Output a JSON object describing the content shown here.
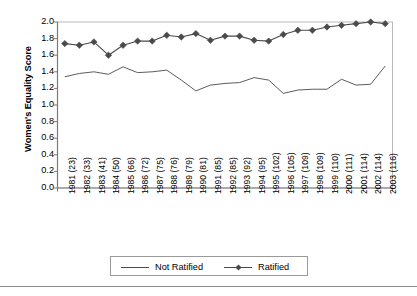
{
  "chart_data": {
    "type": "line",
    "title": "",
    "xlabel": "",
    "ylabel": "Women's Equality Score",
    "ylim": [
      0.0,
      2.0
    ],
    "ytick_step": 0.2,
    "yticks": [
      "0.0",
      "0.2",
      "0.4",
      "0.6",
      "0.8",
      "1.0",
      "1.2",
      "1.4",
      "1.6",
      "1.8",
      "2.0"
    ],
    "grid": false,
    "legend_position": "bottom-center",
    "categories": [
      "1981 (23)",
      "1982 (33)",
      "1983 (41)",
      "1984 (50)",
      "1985 (66)",
      "1986 (72)",
      "1987 (75)",
      "1988 (76)",
      "1989 (79)",
      "1990 (81)",
      "1991 (85)",
      "1992 (85)",
      "1993 (92)",
      "1994 (95)",
      "1995 (102)",
      "1996 (105)",
      "1997 (109)",
      "1998 (109)",
      "1999 (110)",
      "2000 (111)",
      "2001 (114)",
      "2002 (114)",
      "2003 (116)"
    ],
    "series": [
      {
        "name": "Not Ratified",
        "marker": "none",
        "color": "#4a4a4a",
        "values": [
          1.34,
          1.38,
          1.4,
          1.37,
          1.46,
          1.39,
          1.4,
          1.42,
          1.3,
          1.17,
          1.24,
          1.26,
          1.27,
          1.33,
          1.3,
          1.14,
          1.18,
          1.19,
          1.19,
          1.31,
          1.24,
          1.25,
          1.47
        ]
      },
      {
        "name": "Ratified",
        "marker": "diamond",
        "color": "#4a4a4a",
        "values": [
          1.74,
          1.72,
          1.76,
          1.6,
          1.72,
          1.77,
          1.77,
          1.84,
          1.82,
          1.86,
          1.78,
          1.83,
          1.83,
          1.78,
          1.77,
          1.85,
          1.9,
          1.9,
          1.94,
          1.96,
          1.98,
          2.0,
          1.98
        ]
      }
    ],
    "legend": [
      {
        "label": "Not Ratified",
        "marker": "none"
      },
      {
        "label": "Ratified",
        "marker": "diamond"
      }
    ]
  },
  "axis": {
    "y_title": "Women's Equality Score"
  },
  "colors": {
    "line": "#4a4a4a",
    "axis": "#7a7a7a",
    "text": "#000000",
    "legend_border": "#9a9a9a",
    "rule": "#8d8d8d"
  }
}
